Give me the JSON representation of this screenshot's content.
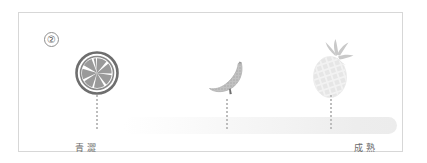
{
  "figure": {
    "index_marker": "②",
    "scale": {
      "start_label": "青澀",
      "end_label": "成熟",
      "bar_color_start": "#f3f3f3",
      "bar_color_end": "#ececec"
    },
    "stages": [
      {
        "id": "unripe",
        "icon": "citrus-slice-icon",
        "icon_color": "#7d7d7d",
        "connector": "dotted-line"
      },
      {
        "id": "mid",
        "icon": "banana-icon",
        "icon_color": "#b5b5b5",
        "connector": "dotted-line"
      },
      {
        "id": "ripe",
        "icon": "pineapple-icon",
        "icon_color": "#ededed",
        "connector": "dotted-line"
      }
    ]
  }
}
